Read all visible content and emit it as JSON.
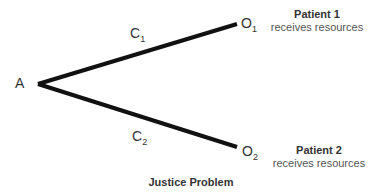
{
  "diagram": {
    "title": "Justice Problem",
    "start_node": {
      "label": "A"
    },
    "branches": [
      {
        "choice": {
          "letter": "C",
          "sub": "1"
        },
        "outcome": {
          "letter": "O",
          "sub": "1"
        },
        "patient": "Patient 1",
        "description": "receives resources"
      },
      {
        "choice": {
          "letter": "C",
          "sub": "2"
        },
        "outcome": {
          "letter": "O",
          "sub": "2"
        },
        "patient": "Patient 2",
        "description": "receives resources"
      }
    ],
    "colors": {
      "line": "#111111",
      "text": "#333333"
    }
  }
}
